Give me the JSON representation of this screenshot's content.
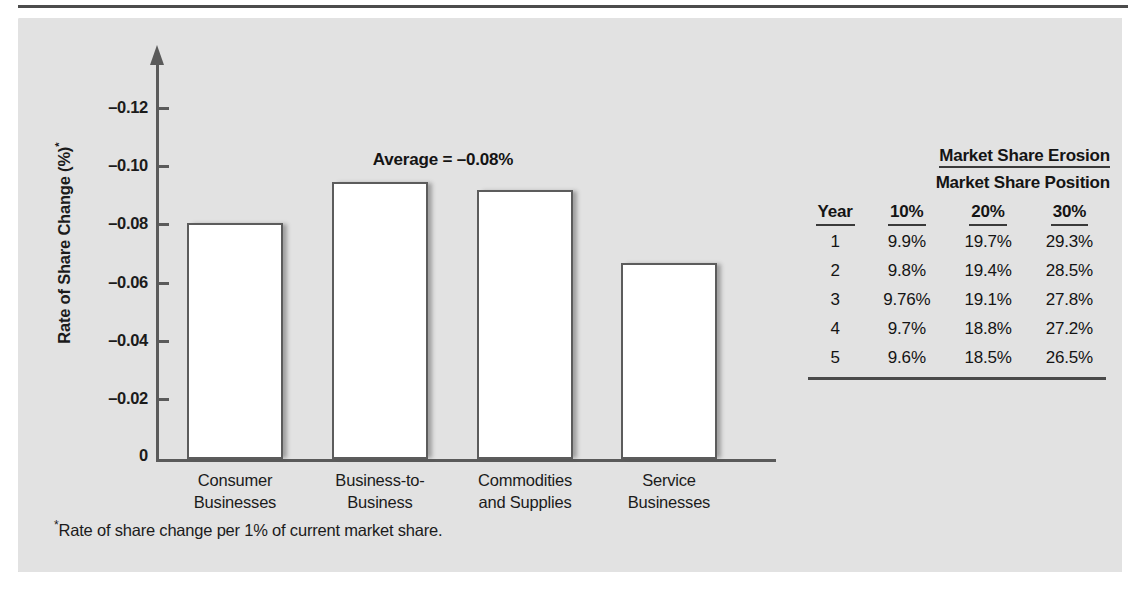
{
  "figure": {
    "y_axis_label": "Rate of Share Change (%)",
    "y_axis_label_sup": "*",
    "average_annotation": "Average = –0.08%",
    "footnote_marker": "*",
    "footnote": "Rate of share change per 1% of current market share."
  },
  "chart_data": {
    "type": "bar",
    "title": "",
    "xlabel": "",
    "ylabel": "Rate of Share Change (%)*",
    "categories": [
      "Consumer Businesses",
      "Business-to-Business",
      "Commodities and Supplies",
      "Service Businesses"
    ],
    "category_lines": [
      [
        "Consumer",
        "Businesses"
      ],
      [
        "Business-to-",
        "Business"
      ],
      [
        "Commodities",
        "and Supplies"
      ],
      [
        "Service",
        "Businesses"
      ]
    ],
    "values": [
      -0.074,
      -0.088,
      -0.085,
      -0.06
    ],
    "ylim": [
      0,
      -0.13
    ],
    "ytick_labels": [
      "–0.12",
      "–0.10",
      "–0.08",
      "–0.06",
      "–0.04",
      "–0.02",
      "0"
    ],
    "ytick_values": [
      -0.12,
      -0.1,
      -0.08,
      -0.06,
      -0.04,
      -0.02,
      0
    ],
    "grid": false,
    "legend": "none",
    "annotations": [
      "Average = –0.08%"
    ],
    "average": -0.08,
    "bar_fill_color": "#ffffff",
    "bar_edge_color": "#5c5c5c",
    "panel_color": "#e2e2e2"
  },
  "table": {
    "title": "Market Share Erosion",
    "subtitle": "Market Share Position",
    "columns": [
      "Year",
      "10%",
      "20%",
      "30%"
    ],
    "rows": [
      [
        "1",
        "9.9%",
        "19.7%",
        "29.3%"
      ],
      [
        "2",
        "9.8%",
        "19.4%",
        "28.5%"
      ],
      [
        "3",
        "9.76%",
        "19.1%",
        "27.8%"
      ],
      [
        "4",
        "9.7%",
        "18.8%",
        "27.2%"
      ],
      [
        "5",
        "9.6%",
        "18.5%",
        "26.5%"
      ]
    ]
  }
}
